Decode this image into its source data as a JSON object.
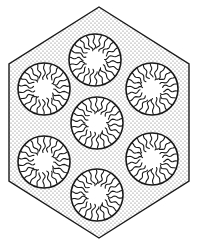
{
  "diagram": {
    "colors": {
      "background": "#ffffff",
      "outline": "#1a1a1a",
      "stipple": "#6a6a6a",
      "micelle_fill": "#ffffff"
    },
    "hexagon": {
      "points": [
        [
          99,
          7
        ],
        [
          189,
          64
        ],
        [
          189,
          181
        ],
        [
          99,
          238
        ],
        [
          9,
          181
        ],
        [
          9,
          64
        ]
      ],
      "stroke_width": 1.4
    },
    "micelles": [
      {
        "id": "top",
        "cx": 95,
        "cy": 60,
        "r": 26,
        "core_r": 8
      },
      {
        "id": "upper-left",
        "cx": 44,
        "cy": 89,
        "r": 26,
        "core_r": 8
      },
      {
        "id": "upper-right",
        "cx": 152,
        "cy": 89,
        "r": 26,
        "core_r": 8
      },
      {
        "id": "center",
        "cx": 97,
        "cy": 123,
        "r": 26,
        "core_r": 8
      },
      {
        "id": "lower-left",
        "cx": 44,
        "cy": 162,
        "r": 26,
        "core_r": 8
      },
      {
        "id": "lower-right",
        "cx": 152,
        "cy": 159,
        "r": 26,
        "core_r": 8
      },
      {
        "id": "bottom",
        "cx": 97,
        "cy": 195,
        "r": 26,
        "core_r": 8
      }
    ],
    "chains_per_micelle": 22
  }
}
